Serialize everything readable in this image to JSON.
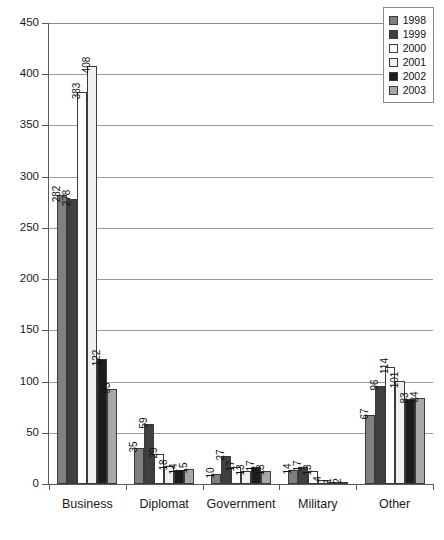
{
  "chart_data": {
    "type": "bar",
    "title": "",
    "subtitle": "",
    "xlabel": "",
    "ylabel": "",
    "ylim": [
      0,
      450
    ],
    "ytick_step": 50,
    "yticks": [
      0,
      50,
      100,
      150,
      200,
      250,
      300,
      350,
      400,
      450
    ],
    "grid": "horizontal",
    "legend_position": "top-right",
    "categories": [
      "Business",
      "Diplomat",
      "Government",
      "Military",
      "Other"
    ],
    "series": [
      {
        "name": "1998",
        "color": "#808080",
        "values": [
          282,
          35,
          10,
          14,
          67
        ]
      },
      {
        "name": "1999",
        "color": "#404040",
        "values": [
          278,
          59,
          27,
          17,
          96
        ]
      },
      {
        "name": "2000",
        "color": "#ffffff",
        "values": [
          383,
          29,
          17,
          13,
          114
        ]
      },
      {
        "name": "2001",
        "color": "#f0f0f0",
        "values": [
          408,
          18,
          13,
          4,
          101
        ]
      },
      {
        "name": "2002",
        "color": "#1c1c1c",
        "values": [
          122,
          14,
          17,
          1,
          83
        ]
      },
      {
        "name": "2003",
        "color": "#a8a8a8",
        "values": [
          93,
          15,
          13,
          2,
          84
        ]
      }
    ],
    "colors": {
      "axis": "#5a5a5a",
      "gridline": "#9b9b9b",
      "bar_outline": "#3a3a3a",
      "text": "#1a1a1a"
    }
  }
}
